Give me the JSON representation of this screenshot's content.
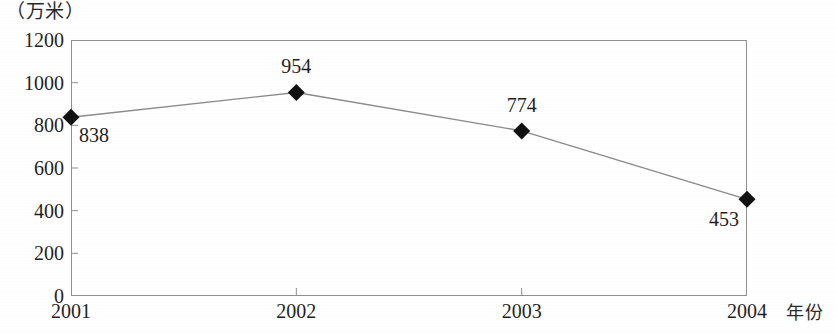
{
  "chart_data": {
    "type": "line",
    "title": "",
    "subtitle": "",
    "xlabel": "年份",
    "ylabel": "（万米）",
    "categories": [
      "2001",
      "2002",
      "2003",
      "2004"
    ],
    "values": [
      838,
      954,
      774,
      453
    ],
    "series": [
      {
        "name": "",
        "values": [
          838,
          954,
          774,
          453
        ]
      }
    ],
    "point_labels": [
      "838",
      "954",
      "774",
      "453"
    ],
    "ylim": [
      0,
      1200
    ],
    "y_ticks": [
      "0",
      "200",
      "400",
      "600",
      "800",
      "1000",
      "1200"
    ],
    "y_tick_values": [
      0,
      200,
      400,
      600,
      800,
      1000,
      1200
    ],
    "x_ticks": [
      "2001",
      "2002",
      "2003",
      "2004"
    ],
    "grid": false,
    "legend": "none",
    "marker": "diamond",
    "marker_color": "#111111",
    "line_color": "#8a8a8a",
    "frame_color": "#8f8f8f",
    "background_color": "#ffffff"
  },
  "axes": {
    "y_unit_caption": "（万米）",
    "x_axis_title": "年份"
  }
}
